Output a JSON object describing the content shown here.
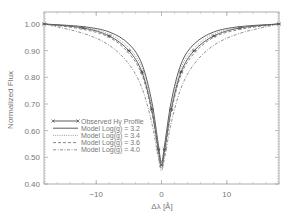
{
  "chart_data": {
    "type": "line",
    "title": "",
    "xlabel": "Δλ [Å]",
    "ylabel": "Normalized Flux",
    "xlim": [
      -18,
      18
    ],
    "ylim": [
      0.4,
      1.05
    ],
    "x_ticks": [
      -10,
      0,
      10
    ],
    "x_tick_labels": [
      "−10",
      "0",
      "10"
    ],
    "y_ticks": [
      0.4,
      0.5,
      0.6,
      0.7,
      0.8,
      0.9,
      1.0
    ],
    "y_tick_labels": [
      "0.40",
      "0.50",
      "0.60",
      "0.70",
      "0.80",
      "0.90",
      "1.00"
    ],
    "grid": false,
    "legend_position": "lower left",
    "series": [
      {
        "name": "Observed Hγ Profile",
        "style": "solid-asterisk",
        "x": [
          -18,
          -12,
          -8,
          -5,
          -3,
          -1.5,
          -0.5,
          0,
          0.5,
          1.5,
          3,
          5,
          8,
          12,
          18
        ],
        "y": [
          1.0,
          0.985,
          0.955,
          0.9,
          0.82,
          0.68,
          0.53,
          0.47,
          0.53,
          0.68,
          0.82,
          0.9,
          0.955,
          0.985,
          1.0
        ]
      },
      {
        "name": "Model Log(g) = 3.2",
        "style": "solid",
        "x": [
          -18,
          -12,
          -8,
          -5,
          -3,
          -1.5,
          -0.5,
          0,
          0.5,
          1.5,
          3,
          5,
          8,
          12,
          18
        ],
        "y": [
          1.0,
          0.99,
          0.97,
          0.925,
          0.85,
          0.71,
          0.55,
          0.48,
          0.55,
          0.71,
          0.85,
          0.925,
          0.97,
          0.99,
          1.0
        ]
      },
      {
        "name": "Model Log(g) = 3.4",
        "style": "dotted",
        "x": [
          -18,
          -12,
          -8,
          -5,
          -3,
          -1.5,
          -0.5,
          0,
          0.5,
          1.5,
          3,
          5,
          8,
          12,
          18
        ],
        "y": [
          1.0,
          0.987,
          0.962,
          0.91,
          0.835,
          0.69,
          0.54,
          0.47,
          0.54,
          0.69,
          0.835,
          0.91,
          0.962,
          0.987,
          1.0
        ]
      },
      {
        "name": "Model Log(g) = 3.6",
        "style": "dashed",
        "x": [
          -18,
          -12,
          -8,
          -5,
          -3,
          -1.5,
          -0.5,
          0,
          0.5,
          1.5,
          3,
          5,
          8,
          12,
          18
        ],
        "y": [
          1.0,
          0.98,
          0.95,
          0.89,
          0.81,
          0.67,
          0.52,
          0.46,
          0.52,
          0.67,
          0.81,
          0.89,
          0.95,
          0.98,
          1.0
        ]
      },
      {
        "name": "Model Log(g) = 4.0",
        "style": "dash-dot",
        "x": [
          -18,
          -12,
          -8,
          -5,
          -3,
          -1.5,
          -0.5,
          0,
          0.5,
          1.5,
          3,
          5,
          8,
          12,
          18
        ],
        "y": [
          1.0,
          0.965,
          0.92,
          0.85,
          0.76,
          0.63,
          0.5,
          0.45,
          0.5,
          0.63,
          0.76,
          0.85,
          0.92,
          0.965,
          1.0
        ]
      }
    ],
    "legend": [
      {
        "label": "Observed Hγ Profile"
      },
      {
        "label": "Model Log(g) = 3.2"
      },
      {
        "label": "Model Log(g) = 3.4"
      },
      {
        "label": "Model Log(g) = 3.6"
      },
      {
        "label": "Model Log(g) = 4.0"
      }
    ]
  }
}
